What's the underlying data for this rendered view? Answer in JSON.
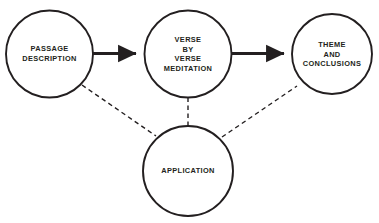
{
  "diagram": {
    "type": "flow-diagram",
    "background_color": "#ffffff",
    "stroke_color": "#231f20",
    "text_color": "#231f20",
    "nodes": [
      {
        "id": "passage-description",
        "label": "PASSAGE\nDESCRIPTION",
        "shape": "circle",
        "cx": 49.5,
        "cy": 54,
        "r": 43.5
      },
      {
        "id": "verse-by-verse-meditation",
        "label": "VERSE\nBY\nVERSE\nMEDITATION",
        "shape": "circle",
        "cx": 188,
        "cy": 54,
        "r": 43.5
      },
      {
        "id": "theme-and-conclusions",
        "label": "THEME\nAND\nCONCLUSIONS",
        "shape": "circle",
        "cx": 332,
        "cy": 54,
        "r": 40
      },
      {
        "id": "application",
        "label": "APPLICATION",
        "shape": "circle",
        "cx": 188,
        "cy": 171,
        "r": 45
      }
    ],
    "connectors": [
      {
        "id": "passage-to-verse",
        "from": "passage-description",
        "to": "verse-by-verse-meditation",
        "style": "solid-arrow",
        "x1": 93,
        "y1": 53.5,
        "x2": 144,
        "y2": 53.5
      },
      {
        "id": "verse-to-theme",
        "from": "verse-by-verse-meditation",
        "to": "theme-and-conclusions",
        "style": "solid-arrow",
        "x1": 232,
        "y1": 53.5,
        "x2": 292,
        "y2": 53.5
      },
      {
        "id": "passage-to-application",
        "from": "passage-description",
        "to": "application",
        "style": "dashed",
        "x1": 82,
        "y1": 85,
        "x2": 156,
        "y2": 136
      },
      {
        "id": "verse-to-application",
        "from": "verse-by-verse-meditation",
        "to": "application",
        "style": "dashed",
        "x1": 188,
        "y1": 97.5,
        "x2": 188,
        "y2": 126
      },
      {
        "id": "theme-to-application",
        "from": "theme-and-conclusions",
        "to": "application",
        "style": "dashed",
        "x1": 222,
        "y1": 137,
        "x2": 297,
        "y2": 86
      }
    ]
  }
}
